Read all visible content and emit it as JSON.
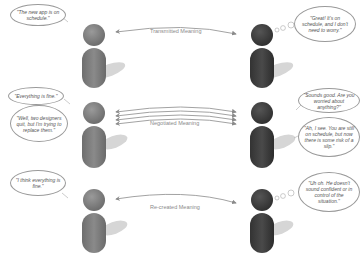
{
  "rows": [
    {
      "label": "Transmitted Meaning",
      "left_bubbles": [
        "\"The new app is on schedule.\""
      ],
      "right_bubbles": [
        "\"Great! It's on schedule, and I don't need to worry.\""
      ],
      "right_style": "thought"
    },
    {
      "label": "Negotiated Meaning",
      "left_bubbles": [
        "\"Everything is fine.\"",
        "\"Well, two designers quit, but I'm trying to replace them.\""
      ],
      "right_bubbles": [
        "\"Sounds good. Are you worried about anything?\"",
        "\"Ah, I see. You are still on schedule, but now there is some risk of a slip.\""
      ],
      "right_style": "speech"
    },
    {
      "label": "Re-created Meaning",
      "left_bubbles": [
        "\"I think everything is fine.\""
      ],
      "right_bubbles": [
        "\"Uh oh. He doesn't sound confident or in control of the situation.\""
      ],
      "right_style": "thought"
    }
  ],
  "colors": {
    "left_figure": "#7d7d7d",
    "right_figure": "#3c3c3c",
    "shadow": "#d4d4d4",
    "arrow": "#8a8a8a"
  }
}
